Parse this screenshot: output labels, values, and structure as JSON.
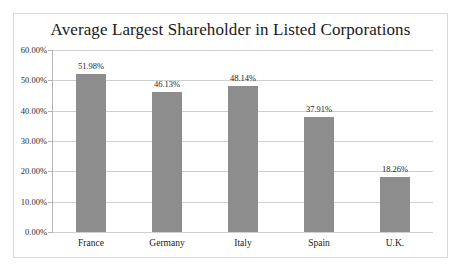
{
  "chart_data": {
    "type": "bar",
    "title": "Average Largest Shareholder in Listed Corporations",
    "xlabel": "",
    "ylabel": "",
    "categories": [
      "France",
      "Germany",
      "Italy",
      "Spain",
      "U.K."
    ],
    "values": [
      51.98,
      46.13,
      48.14,
      37.91,
      18.26
    ],
    "value_labels": [
      "51.98%",
      "46.13%",
      "48.14%",
      "37.91%",
      "18.26%"
    ],
    "ylim": [
      0,
      60
    ],
    "ytick_values": [
      0,
      10,
      20,
      30,
      40,
      50,
      60
    ],
    "ytick_labels": [
      "0.00%",
      "10.00%",
      "20.00%",
      "30.00%",
      "40.00%",
      "50.00%",
      "60.00%"
    ],
    "grid": true,
    "legend": false,
    "series": [
      {
        "name": "Average Largest Shareholder",
        "values": [
          51.98,
          46.13,
          48.14,
          37.91,
          18.26
        ]
      }
    ],
    "colors": {
      "bar": "#8d8d8d",
      "gridline": "#d0d0d0",
      "axis": "#b5b5b5",
      "border": "#d9d9d9",
      "background": "#ffffff",
      "text": "#1a1a1a"
    }
  }
}
